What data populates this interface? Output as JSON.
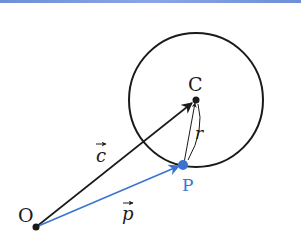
{
  "diagram": {
    "points": {
      "O": {
        "label": "O",
        "x": 36,
        "y": 227
      },
      "C": {
        "label": "C",
        "x": 196,
        "y": 100
      },
      "P": {
        "label": "P",
        "x": 183,
        "y": 165
      }
    },
    "circle": {
      "center": "C",
      "radius_px": 67
    },
    "vectors": {
      "c": {
        "label": "c",
        "from": "O",
        "to": "C",
        "color": "#1a1a1a"
      },
      "p": {
        "label": "p",
        "from": "O",
        "to": "P",
        "color": "#3a74d0"
      },
      "r": {
        "label": "r",
        "from": "P",
        "to": "C",
        "color": "#1a1a1a"
      }
    },
    "colors": {
      "black": "#1a1a1a",
      "blue": "#3a74d0",
      "accent_bar": "#7d9ae0"
    }
  }
}
